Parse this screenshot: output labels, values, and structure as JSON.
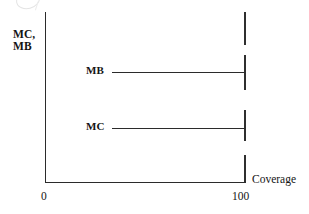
{
  "figure": {
    "kind": "economics-line-diagram",
    "background_color": "#ffffff",
    "ink_color": "#2b2b2b"
  },
  "axes": {
    "y_label": "MC,\nMB",
    "x_label": "Coverage",
    "x_ticks": [
      "0",
      "100"
    ],
    "y_ticks": []
  },
  "curves": [
    {
      "name": "MB",
      "label": "MB",
      "type": "horizontal",
      "level": "high"
    },
    {
      "name": "MC",
      "label": "MC",
      "type": "horizontal",
      "level": "low"
    }
  ],
  "chart_data": {
    "type": "line",
    "title": "",
    "xlabel": "Coverage",
    "ylabel": "MC, MB",
    "xlim": [
      0,
      100
    ],
    "ylim": [
      0,
      1
    ],
    "xticks": [
      0,
      100
    ],
    "xticklabels": [
      "0",
      "100"
    ],
    "yticks": [],
    "yticklabels": [],
    "grid": false,
    "legend": "inline-labels",
    "series": [
      {
        "name": "MB",
        "label": "MB",
        "x": [
          25,
          100
        ],
        "y": [
          0.645,
          0.645
        ],
        "style": "solid",
        "color": "#2b2b2b",
        "label_position": "left-of-line"
      },
      {
        "name": "MC",
        "label": "MC",
        "x": [
          25,
          100
        ],
        "y": [
          0.315,
          0.315
        ],
        "style": "solid",
        "color": "#2b2b2b",
        "label_position": "left-of-line"
      }
    ],
    "annotations": [
      {
        "text": "100",
        "kind": "x-tick-label",
        "x": 100
      },
      {
        "text": "0",
        "kind": "x-tick-label",
        "x": 0
      },
      {
        "text": "Coverage",
        "kind": "x-axis-title"
      },
      {
        "text": "MC,\nMB",
        "kind": "y-axis-title"
      }
    ]
  }
}
